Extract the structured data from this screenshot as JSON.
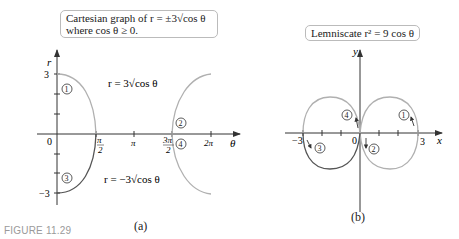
{
  "figure_label": "FIGURE 11.29",
  "panel_a": {
    "label": "(a)",
    "caption_line1": "Cartesian graph of r = ±3√cos θ",
    "caption_line2": "where cos θ ≥ 0.",
    "r_axis_label": "r",
    "theta_axis_label": "θ",
    "origin_label": "0",
    "r_ticks": [
      "3",
      "−3"
    ],
    "theta_ticks": [
      "π/2",
      "π",
      "3π/2",
      "2π"
    ],
    "curve_top_label": "r = 3√cos θ",
    "curve_bottom_label": "r = −3√cos θ",
    "markers": [
      "1",
      "2",
      "3",
      "4"
    ]
  },
  "panel_b": {
    "label": "(b)",
    "caption": "Lemniscate r² = 9 cos θ",
    "x_axis_label": "x",
    "y_axis_label": "y",
    "origin_label": "0",
    "x_ticks": [
      "−3",
      "3"
    ],
    "markers": [
      "1",
      "2",
      "3",
      "4"
    ]
  },
  "colors": {
    "curve_light": "#b0b0b0",
    "curve_dark": "#555555",
    "axis": "#333333"
  }
}
